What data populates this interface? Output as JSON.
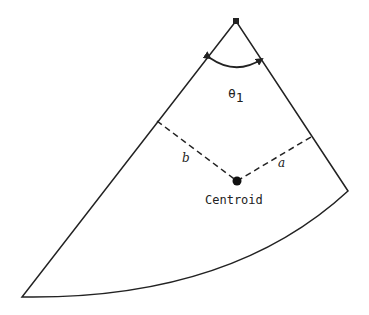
{
  "diagram": {
    "type": "sector-centroid",
    "labels": {
      "angle": "θ",
      "angle_subscript": "1",
      "distance_a": "a",
      "distance_b": "b",
      "centroid": "Centroid"
    },
    "colors": {
      "stroke": "#222222",
      "background": "#ffffff"
    }
  }
}
